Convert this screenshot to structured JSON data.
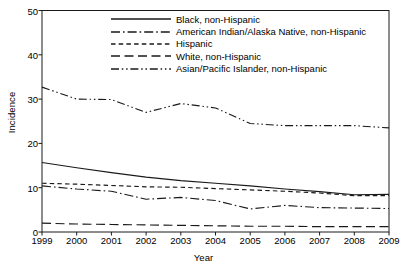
{
  "chart_data": {
    "type": "line",
    "title": "",
    "xlabel": "Year",
    "ylabel": "Incidence",
    "x": [
      1999,
      2000,
      2001,
      2002,
      2003,
      2004,
      2005,
      2006,
      2007,
      2008,
      2009
    ],
    "xticklabels": [
      "1999",
      "2000",
      "2001",
      "2002",
      "2003",
      "2004",
      "2005",
      "2006",
      "2007",
      "2008",
      "2009"
    ],
    "yticklabels": [
      "0",
      "10",
      "20",
      "30",
      "40",
      "50"
    ],
    "yticks": [
      0,
      10,
      20,
      30,
      40,
      50
    ],
    "xlim": [
      1999,
      2009
    ],
    "ylim": [
      0,
      50
    ],
    "grid": false,
    "legend_position": "upper-center",
    "series": [
      {
        "name": "Black, non-Hispanic",
        "dash": "solid",
        "color": "#1a1a1a",
        "values": [
          15.7,
          14.5,
          13.4,
          12.4,
          11.6,
          11.0,
          10.4,
          9.7,
          9.1,
          8.4,
          8.5
        ]
      },
      {
        "name": "American Indian/Alaska Native, non-Hispanic",
        "dash": "dash-dot",
        "color": "#1a1a1a",
        "values": [
          10.4,
          9.7,
          9.2,
          7.4,
          7.8,
          7.1,
          5.2,
          6.0,
          5.5,
          5.4,
          5.3
        ]
      },
      {
        "name": "Hispanic",
        "dash": "dashed",
        "color": "#1a1a1a",
        "values": [
          11.0,
          10.8,
          10.5,
          10.2,
          10.1,
          9.8,
          9.5,
          9.2,
          8.8,
          8.2,
          8.2
        ]
      },
      {
        "name": "White, non-Hispanic",
        "dash": "long-dash",
        "color": "#1a1a1a",
        "values": [
          2.0,
          1.8,
          1.7,
          1.6,
          1.5,
          1.4,
          1.3,
          1.3,
          1.2,
          1.2,
          1.2
        ]
      },
      {
        "name": "Asian/Pacific Islander, non-Hispanic",
        "dash": "dash-dot-dot",
        "color": "#1a1a1a",
        "values": [
          32.7,
          30.0,
          29.9,
          27.0,
          29.0,
          28.0,
          24.5,
          24.0,
          24.0,
          24.0,
          23.5
        ]
      }
    ]
  },
  "legend": {
    "items": [
      {
        "label": "Black, non-Hispanic",
        "dash": "solid"
      },
      {
        "label": "American Indian/Alaska Native, non-Hispanic",
        "dash": "dash-dot"
      },
      {
        "label": "Hispanic",
        "dash": "dashed"
      },
      {
        "label": "White, non-Hispanic",
        "dash": "long-dash"
      },
      {
        "label": "Asian/Pacific Islander, non-Hispanic",
        "dash": "dash-dot-dot"
      }
    ]
  },
  "axes": {
    "x_title": "Year",
    "y_title": "Incidence"
  }
}
